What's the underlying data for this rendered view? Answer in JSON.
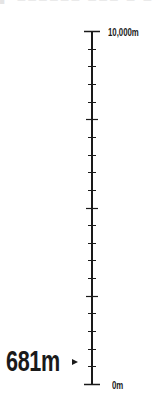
{
  "top_fragment": "▞ ▀▀▀▀▀▀ ▀▀▀ ▀ ▀",
  "altitude_scale": {
    "max_label": "10,000m",
    "min_label": "0m",
    "max_value": 10000,
    "min_value": 0,
    "major_step": 2500,
    "minor_step": 500,
    "unit": "m",
    "line_color": "#1a1a1a"
  },
  "current": {
    "value": 681,
    "label": "681m",
    "marker_icon": "triangle-right-icon"
  }
}
